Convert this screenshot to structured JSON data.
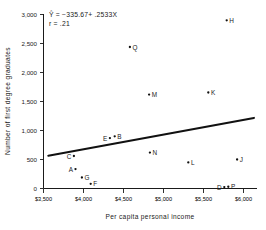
{
  "chart_data": {
    "type": "scatter",
    "title": "",
    "xlabel": "Per capita personal income",
    "ylabel": "Number of first degree graduates",
    "xlim": [
      3500,
      6150
    ],
    "ylim": [
      0,
      3100
    ],
    "xticks": [
      "$3,500",
      "$4,000",
      "$4,500",
      "$5,000",
      "$5,500",
      "$6,000"
    ],
    "xtick_values": [
      3500,
      4000,
      4500,
      5000,
      5500,
      6000
    ],
    "yticks": [
      "0",
      "500",
      "1,000",
      "1,500",
      "2,000",
      "2,500",
      "3,000"
    ],
    "ytick_values": [
      0,
      500,
      1000,
      1500,
      2000,
      2500,
      3000
    ],
    "grid": false,
    "legend": "none",
    "points": [
      {
        "label": "A",
        "x": 3900,
        "y": 335,
        "label_side": "left"
      },
      {
        "label": "B",
        "x": 4390,
        "y": 900,
        "label_side": "right"
      },
      {
        "label": "C",
        "x": 3880,
        "y": 560,
        "label_side": "left"
      },
      {
        "label": "D",
        "x": 5760,
        "y": 25,
        "label_side": "left"
      },
      {
        "label": "E",
        "x": 4330,
        "y": 870,
        "label_side": "left"
      },
      {
        "label": "F",
        "x": 4090,
        "y": 80,
        "label_side": "right"
      },
      {
        "label": "G",
        "x": 3980,
        "y": 190,
        "label_side": "right"
      },
      {
        "label": "H",
        "x": 5790,
        "y": 2900,
        "label_side": "right"
      },
      {
        "label": "J",
        "x": 5920,
        "y": 500,
        "label_side": "right"
      },
      {
        "label": "K",
        "x": 5560,
        "y": 1655,
        "label_side": "right"
      },
      {
        "label": "L",
        "x": 5310,
        "y": 450,
        "label_side": "right"
      },
      {
        "label": "M",
        "x": 4820,
        "y": 1620,
        "label_side": "right"
      },
      {
        "label": "N",
        "x": 4830,
        "y": 620,
        "label_side": "right"
      },
      {
        "label": "P",
        "x": 5810,
        "y": 30,
        "label_side": "right"
      },
      {
        "label": "Q",
        "x": 4580,
        "y": 2440,
        "label_side": "right"
      }
    ],
    "regression": {
      "slope": 0.2533,
      "intercept": -335.67,
      "x_start": 3560,
      "x_end": 6130,
      "y_start": 566,
      "y_end": 1217
    },
    "annotations": {
      "equation": "Ŷ = −335.67+ .2533X",
      "correlation": "r = .21"
    }
  }
}
